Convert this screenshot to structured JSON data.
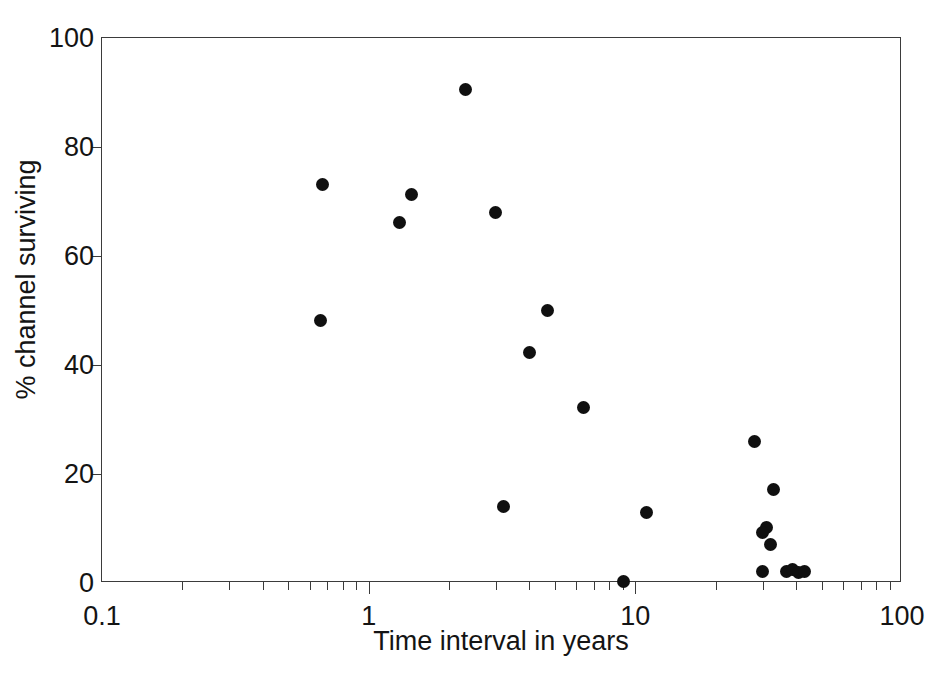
{
  "chart_data": {
    "type": "scatter",
    "title": "",
    "xlabel": "Time interval in years",
    "ylabel": "% channel surviving",
    "xscale": "log",
    "yscale": "linear",
    "xlim": [
      0.1,
      100
    ],
    "ylim": [
      0,
      100
    ],
    "grid": false,
    "legend": null,
    "marker": {
      "shape": "circle",
      "color": "#101010",
      "size_px": 13
    },
    "xticks_major": [
      {
        "value": 0.1,
        "label": "0.1"
      },
      {
        "value": 1,
        "label": "1"
      },
      {
        "value": 10,
        "label": "10"
      },
      {
        "value": 100,
        "label": "100"
      }
    ],
    "xticks_minor": [
      0.2,
      0.3,
      0.4,
      0.5,
      0.6,
      0.7,
      0.8,
      0.9,
      2,
      3,
      4,
      5,
      6,
      7,
      8,
      9,
      20,
      30,
      40,
      50,
      60,
      70,
      80,
      90
    ],
    "yticks": [
      {
        "value": 0,
        "label": "0"
      },
      {
        "value": 20,
        "label": "20"
      },
      {
        "value": 40,
        "label": "40"
      },
      {
        "value": 60,
        "label": "60"
      },
      {
        "value": 80,
        "label": "80"
      },
      {
        "value": 100,
        "label": "100"
      }
    ],
    "points": [
      {
        "x": 2.3,
        "y": 90.5
      },
      {
        "x": 0.67,
        "y": 73.2
      },
      {
        "x": 1.45,
        "y": 71.2
      },
      {
        "x": 1.3,
        "y": 66.2
      },
      {
        "x": 3.0,
        "y": 68.0
      },
      {
        "x": 0.66,
        "y": 48.1
      },
      {
        "x": 4.7,
        "y": 50.0
      },
      {
        "x": 4.0,
        "y": 42.3
      },
      {
        "x": 6.4,
        "y": 32.2
      },
      {
        "x": 28.0,
        "y": 26.0
      },
      {
        "x": 33.0,
        "y": 17.2
      },
      {
        "x": 3.2,
        "y": 14.1
      },
      {
        "x": 11.0,
        "y": 13.0
      },
      {
        "x": 31.0,
        "y": 10.2
      },
      {
        "x": 30.0,
        "y": 9.2
      },
      {
        "x": 32.0,
        "y": 7.0
      },
      {
        "x": 30.0,
        "y": 2.2
      },
      {
        "x": 9.0,
        "y": 0.2
      },
      {
        "x": 37.0,
        "y": 2.2
      },
      {
        "x": 39.0,
        "y": 2.4
      },
      {
        "x": 41.0,
        "y": 2.0
      },
      {
        "x": 43.0,
        "y": 2.1
      }
    ]
  }
}
